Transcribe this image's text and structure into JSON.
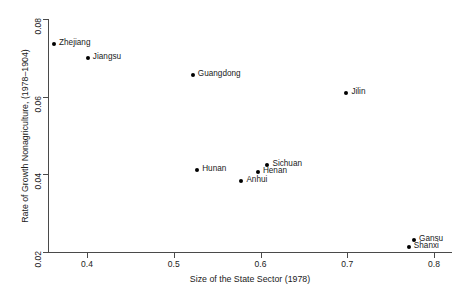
{
  "chart_data": {
    "type": "scatter",
    "title": "",
    "xlabel": "Size of the State Sector (1978)",
    "ylabel": "Rate of Growth Nonagriculture, (1978–1904)",
    "xlim": [
      0.345,
      0.81
    ],
    "ylim": [
      0.0185,
      0.081
    ],
    "xticks": [
      "0.4",
      "0.5",
      "0.6",
      "0.7",
      "0.8"
    ],
    "xtick_values": [
      0.4,
      0.5,
      0.6,
      0.7,
      0.8
    ],
    "yticks": [
      "0.02",
      "0.04",
      "0.06",
      "0.08"
    ],
    "ytick_values": [
      0.02,
      0.04,
      0.06,
      0.08
    ],
    "grid": false,
    "legend": "none",
    "point_color": "#000000",
    "axis_color": "#4a4a4a",
    "points": [
      {
        "label": "Zhejiang",
        "x": 0.362,
        "y": 0.0735
      },
      {
        "label": "Jiangsu",
        "x": 0.401,
        "y": 0.07
      },
      {
        "label": "Guangdong",
        "x": 0.522,
        "y": 0.0655
      },
      {
        "label": "Jilin",
        "x": 0.699,
        "y": 0.061
      },
      {
        "label": "Sichuan",
        "x": 0.608,
        "y": 0.0425
      },
      {
        "label": "Hunan",
        "x": 0.527,
        "y": 0.0412
      },
      {
        "label": "Henan",
        "x": 0.597,
        "y": 0.0405
      },
      {
        "label": "Anhui",
        "x": 0.578,
        "y": 0.0382
      },
      {
        "label": "Gansu",
        "x": 0.777,
        "y": 0.023
      },
      {
        "label": "Shanxi",
        "x": 0.771,
        "y": 0.0212
      }
    ]
  }
}
